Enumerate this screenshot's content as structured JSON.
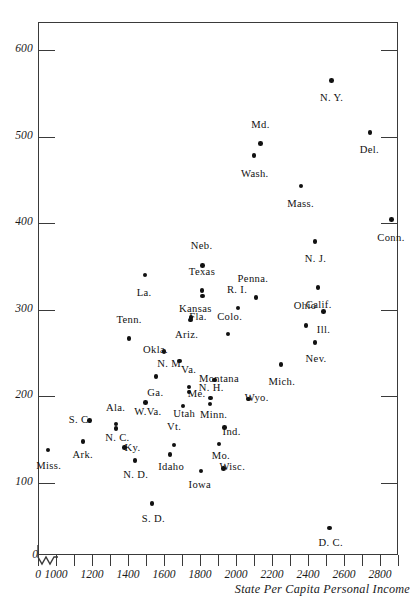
{
  "chart_data": {
    "type": "scatter",
    "title": "",
    "xlabel": "State Per Capita Personal Income",
    "ylabel": "",
    "xlim": [
      900,
      2900
    ],
    "ylim": [
      0,
      650
    ],
    "grid": false,
    "legend": "none",
    "x_ticks": [
      1000,
      1200,
      1400,
      1600,
      1800,
      2000,
      2200,
      2400,
      2600,
      2800
    ],
    "x_minor_ticks": [
      900,
      1100,
      1300,
      1500,
      1700,
      1900,
      2100,
      2300,
      2500,
      2700,
      2900
    ],
    "y_ticks": [
      100,
      200,
      300,
      400,
      500,
      600
    ],
    "x_axis_origin_label": "0",
    "y_axis_origin_label": "0",
    "axis_break": true,
    "points": [
      {
        "label": "N. Y.",
        "x": 2530,
        "y": 565,
        "lx": 2530,
        "ly": 543,
        "align": "center"
      },
      {
        "label": "Del.",
        "x": 2745,
        "y": 505,
        "lx": 2740,
        "ly": 483,
        "align": "center"
      },
      {
        "label": "Md.",
        "x": 2135,
        "y": 492,
        "lx": 2135,
        "ly": 512,
        "align": "center"
      },
      {
        "label": "Wash.",
        "x": 2100,
        "y": 478,
        "lx": 2105,
        "ly": 456,
        "align": "center"
      },
      {
        "label": "Mass.",
        "x": 2360,
        "y": 443,
        "lx": 2360,
        "ly": 421,
        "align": "center"
      },
      {
        "label": "Conn.",
        "x": 2865,
        "y": 404,
        "lx": 2860,
        "ly": 382,
        "align": "center"
      },
      {
        "label": "N. J.",
        "x": 2440,
        "y": 379,
        "lx": 2440,
        "ly": 357,
        "align": "center"
      },
      {
        "label": "Neb.",
        "x": 1815,
        "y": 351,
        "lx": 1810,
        "ly": 373,
        "align": "center"
      },
      {
        "label": "La.",
        "x": 1495,
        "y": 340,
        "lx": 1490,
        "ly": 318,
        "align": "center"
      },
      {
        "label": "Calif.",
        "x": 2455,
        "y": 326,
        "lx": 2460,
        "ly": 304,
        "align": "center"
      },
      {
        "label": "Texas",
        "x": 1810,
        "y": 322,
        "lx": 1810,
        "ly": 343,
        "align": "center"
      },
      {
        "label": "Penna.",
        "x": 2110,
        "y": 314,
        "lx": 2095,
        "ly": 334,
        "align": "center"
      },
      {
        "label": "Kansas",
        "x": 1813,
        "y": 316,
        "lx": 1775,
        "ly": 300,
        "align": "center"
      },
      {
        "label": "R. I.",
        "x": 2010,
        "y": 302,
        "lx": 2005,
        "ly": 322,
        "align": "center"
      },
      {
        "label": "Ill.",
        "x": 2485,
        "y": 298,
        "lx": 2485,
        "ly": 276,
        "align": "center"
      },
      {
        "label": "Fla.",
        "x": 1750,
        "y": 291,
        "lx": 1790,
        "ly": 290,
        "align": "center"
      },
      {
        "label": "Ohio",
        "x": 2390,
        "y": 282,
        "lx": 2385,
        "ly": 303,
        "align": "center"
      },
      {
        "label": "Ariz.",
        "x": 1748,
        "y": 288,
        "lx": 1725,
        "ly": 270,
        "align": "center"
      },
      {
        "label": "Colo.",
        "x": 1955,
        "y": 272,
        "lx": 1965,
        "ly": 291,
        "align": "center"
      },
      {
        "label": "Tenn.",
        "x": 1405,
        "y": 267,
        "lx": 1405,
        "ly": 287,
        "align": "center"
      },
      {
        "label": "Nev.",
        "x": 2440,
        "y": 262,
        "lx": 2445,
        "ly": 242,
        "align": "center"
      },
      {
        "label": "Okla.",
        "x": 1600,
        "y": 252,
        "lx": 1553,
        "ly": 252,
        "align": "center"
      },
      {
        "label": "N. M.",
        "x": 1685,
        "y": 241,
        "lx": 1638,
        "ly": 236,
        "align": "center"
      },
      {
        "label": "Mich.",
        "x": 2250,
        "y": 237,
        "lx": 2255,
        "ly": 216,
        "align": "center"
      },
      {
        "label": "Ga.",
        "x": 1555,
        "y": 223,
        "lx": 1552,
        "ly": 203,
        "align": "center"
      },
      {
        "label": "Montana",
        "x": 1880,
        "y": 219,
        "lx": 1905,
        "ly": 219,
        "align": "center"
      },
      {
        "label": "Va.",
        "x": 1740,
        "y": 211,
        "lx": 1738,
        "ly": 229,
        "align": "center"
      },
      {
        "label": "Me.",
        "x": 1740,
        "y": 205,
        "lx": 1782,
        "ly": 202,
        "align": "center"
      },
      {
        "label": "N. H.",
        "x": 1857,
        "y": 198,
        "lx": 1862,
        "ly": 208,
        "align": "center"
      },
      {
        "label": "Wyo.",
        "x": 2070,
        "y": 197,
        "lx": 2115,
        "ly": 197,
        "align": "center"
      },
      {
        "label": "W.Va.",
        "x": 1498,
        "y": 193,
        "lx": 1510,
        "ly": 181,
        "align": "center"
      },
      {
        "label": "Utah",
        "x": 1705,
        "y": 189,
        "lx": 1712,
        "ly": 179,
        "align": "center"
      },
      {
        "label": "Minn.",
        "x": 1855,
        "y": 191,
        "lx": 1875,
        "ly": 177,
        "align": "center"
      },
      {
        "label": "S. C.",
        "x": 1185,
        "y": 172,
        "lx": 1135,
        "ly": 172,
        "align": "center"
      },
      {
        "label": "Ala.",
        "x": 1333,
        "y": 168,
        "lx": 1330,
        "ly": 186,
        "align": "center"
      },
      {
        "label": "N. C.",
        "x": 1333,
        "y": 163,
        "lx": 1340,
        "ly": 151,
        "align": "center"
      },
      {
        "label": "Ind.",
        "x": 1935,
        "y": 164,
        "lx": 1975,
        "ly": 158,
        "align": "center"
      },
      {
        "label": "Ark.",
        "x": 1150,
        "y": 148,
        "lx": 1150,
        "ly": 131,
        "align": "center"
      },
      {
        "label": "Mo.",
        "x": 1905,
        "y": 145,
        "lx": 1915,
        "ly": 130,
        "align": "center"
      },
      {
        "label": "Vt.",
        "x": 1655,
        "y": 144,
        "lx": 1655,
        "ly": 163,
        "align": "center"
      },
      {
        "label": "Ky.",
        "x": 1380,
        "y": 141,
        "lx": 1425,
        "ly": 139,
        "align": "center"
      },
      {
        "label": "Miss.",
        "x": 955,
        "y": 138,
        "lx": 960,
        "ly": 119,
        "align": "center"
      },
      {
        "label": "Idaho",
        "x": 1633,
        "y": 133,
        "lx": 1640,
        "ly": 117,
        "align": "center"
      },
      {
        "label": "N. D.",
        "x": 1440,
        "y": 126,
        "lx": 1443,
        "ly": 108,
        "align": "center"
      },
      {
        "label": "Wisc.",
        "x": 1930,
        "y": 117,
        "lx": 1980,
        "ly": 117,
        "align": "center"
      },
      {
        "label": "Iowa",
        "x": 1805,
        "y": 114,
        "lx": 1800,
        "ly": 96,
        "align": "center"
      },
      {
        "label": "S. D.",
        "x": 1533,
        "y": 76,
        "lx": 1540,
        "ly": 57,
        "align": "center"
      },
      {
        "label": "D. C.",
        "x": 2520,
        "y": 48,
        "lx": 2525,
        "ly": 29,
        "align": "center"
      }
    ]
  }
}
